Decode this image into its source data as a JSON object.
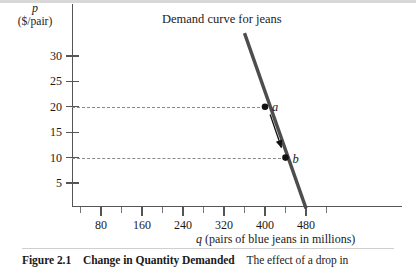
{
  "chart_data": {
    "type": "line",
    "title": "Demand curve for jeans",
    "xlabel_symbol": "q",
    "xlabel_text": "(pairs of blue jeans in millions)",
    "ylabel_symbol": "p",
    "ylabel_text": "($/pair)",
    "xlim": [
      0,
      560
    ],
    "ylim": [
      0,
      35
    ],
    "xticks": [
      80,
      160,
      240,
      320,
      400,
      480
    ],
    "xtick_labels": [
      "80",
      "160",
      "240",
      "320",
      "400",
      "480"
    ],
    "xminor_ticks": [
      40,
      120,
      200,
      280,
      360,
      440,
      520
    ],
    "yticks": [
      5,
      10,
      15,
      20,
      25,
      30
    ],
    "ytick_labels": [
      "5",
      "10",
      "15",
      "20",
      "25",
      "30"
    ],
    "grid": false,
    "legend": "none",
    "series": [
      {
        "name": "Demand curve for jeans",
        "type": "line",
        "color": "#4d4d4d",
        "x": [
          360,
          480
        ],
        "y": [
          34.5,
          0.0
        ]
      }
    ],
    "points": [
      {
        "label": "a",
        "x": 400,
        "y": 20,
        "color": "#111111"
      },
      {
        "label": "b",
        "x": 440,
        "y": 10,
        "color": "#111111"
      }
    ],
    "guides": [
      {
        "orientation": "horizontal",
        "value": 20,
        "from_x": 72,
        "style": "dashed"
      },
      {
        "orientation": "horizontal",
        "value": 10,
        "from_x": 72,
        "style": "dashed"
      }
    ],
    "annotations": [
      {
        "name": "movement-arrow",
        "type": "arrow",
        "from": {
          "x": 410,
          "y": 18.5
        },
        "to": {
          "x": 432,
          "y": 12.0
        },
        "color": "#111111"
      }
    ]
  },
  "caption": {
    "figure_number": "Figure 2.1",
    "figure_title": "Change in Quantity Demanded",
    "figure_body": "The effect of a drop in"
  },
  "colors": {
    "curve": "#4d4d4d",
    "axis": "#555555",
    "guide": "#8a8a8a",
    "point": "#111111",
    "text": "#1a1a1a"
  }
}
